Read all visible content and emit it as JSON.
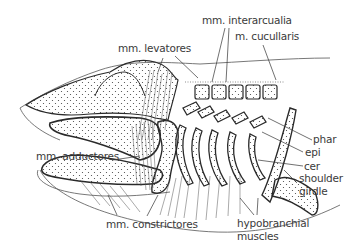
{
  "figure": {
    "labels": {
      "mm_interarcualia": "mm. interarcualia",
      "m_cucullaris": "m. cucullaris",
      "mm_levatores": "mm. levatores",
      "phar": "phar",
      "epi": "epi",
      "cer": "cer",
      "shoulder_girdle_line1": "shoulder",
      "shoulder_girdle_line2": "girdle",
      "mm_adductores": "mm. adductores",
      "mm_constrictores": "mm. constrictores",
      "hypobranchial_line1": "hypobranchial",
      "hypobranchial_line2": "muscles"
    },
    "colors": {
      "line": "#2a2a2a",
      "label": "#3a3a3a",
      "background": "#ffffff"
    }
  }
}
